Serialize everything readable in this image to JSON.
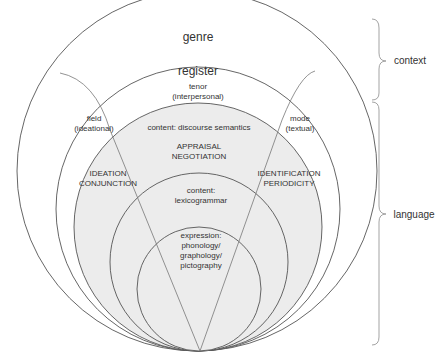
{
  "diagram": {
    "strata": {
      "genre": "genre",
      "register": "register",
      "tenor_line1": "tenor",
      "tenor_line2": "(interpersonal)",
      "field_line1": "field",
      "field_line2": "(ideational)",
      "mode_line1": "mode",
      "mode_line2": "(textual)",
      "discourse_semantics": "content: discourse semantics",
      "interpersonal_systems_line1": "APPRAISAL",
      "interpersonal_systems_line2": "NEGOTIATION",
      "ideational_systems_line1": "IDEATION",
      "ideational_systems_line2": "CONJUNCTION",
      "textual_systems_line1": "IDENTIFICATION",
      "textual_systems_line2": "PERIODICITY",
      "lexicogrammar_line1": "content:",
      "lexicogrammar_line2": "lexicogrammar",
      "expression_line1": "expression:",
      "expression_line2": "phonology/",
      "expression_line3": "graphology/",
      "expression_line4": "pictography"
    },
    "brackets": {
      "context": "context",
      "language": "language"
    },
    "colors": {
      "line": "#555555",
      "shade": "#ececec",
      "bracket": "#999999",
      "text": "#333333"
    }
  }
}
